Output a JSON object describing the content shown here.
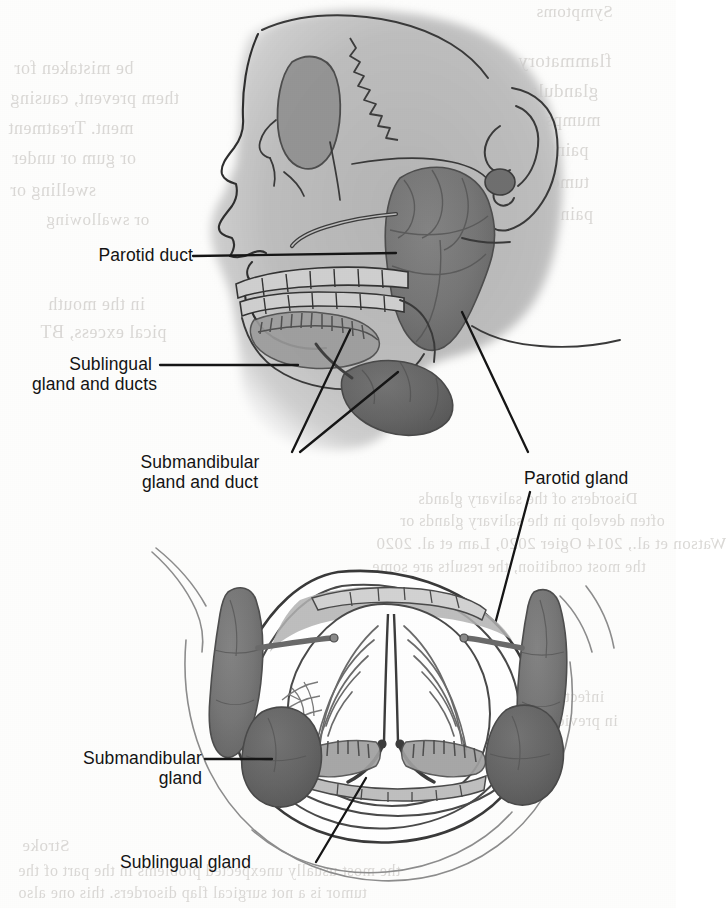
{
  "figure": {
    "title": "Salivary glands",
    "views": [
      {
        "name": "lateral-view",
        "description": "Lateral view of head showing parotid, submandibular and sublingual glands"
      },
      {
        "name": "anterior-view",
        "description": "Anterior open-mouth view showing tongue underside and paired salivary glands"
      }
    ]
  },
  "labels": {
    "parotid_duct": "Parotid duct",
    "sublingual_line1": "Sublingual",
    "sublingual_line2": "gland and ducts",
    "submandibular_line1": "Submandibular",
    "submandibular_line2": "gland and duct",
    "parotid_gland": "Parotid gland",
    "submandibular_gland_line1": "Submandibular",
    "submandibular_gland_line2": "gland",
    "sublingual_gland": "Sublingual gland"
  },
  "colors": {
    "gland_dark": "#6d6d6d",
    "gland_mid": "#7d7d7d",
    "face_fill": "#b9b9b9",
    "skull_fill": "#c2c2c2",
    "outline": "#3a3a3a",
    "label_text": "#141414",
    "bleed_text": "#d9d7d4",
    "page_background": "#fdfdfc"
  },
  "bleedthrough": {
    "note": "faint mirrored text showing through from the reverse side of the scanned page",
    "top_right": [
      "Symptoms",
      "flammatory",
      "glandular",
      "mumps.",
      "painful",
      "tumors",
      "pain"
    ],
    "top_left": [
      "be mistaken for",
      "them prevent, causing",
      "ment. Treatment",
      "or gum or under",
      "swelling or",
      "or swallowing"
    ],
    "mid_left": [
      "in the mouth",
      "pical excess, BT"
    ],
    "mid_right": [
      "Disorders of the salivary glands",
      "often develop in the salivary glands or",
      "Watson et al., 2014 Ogier 2020, Lam et al. 2020",
      "the most condition, the results are some"
    ],
    "lower_right": [
      "infection or the the recurrence",
      "in previous chronic infection or",
      "the parotid is"
    ],
    "bottom": [
      "Stroke",
      "the most usually unexpected problems in the part of the",
      "tumor is a not surgical flap disorders. this one also"
    ]
  }
}
